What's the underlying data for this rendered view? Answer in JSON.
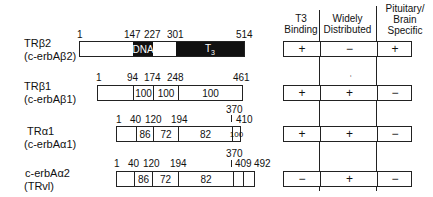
{
  "receptors": [
    {
      "name": "TRβ2",
      "alias": "(c-erbAβ2)",
      "positions": [
        "1",
        "147",
        "227",
        "301",
        "514"
      ],
      "domains": [
        {
          "label": "",
          "style": "white"
        },
        {
          "label": "DNA",
          "style": "black"
        },
        {
          "label": "",
          "style": "white"
        },
        {
          "label": "T3",
          "style": "black"
        }
      ],
      "t3_binding": "+",
      "widely_distributed": "−",
      "pituitary_brain_specific": "+"
    },
    {
      "name": "TRβ1",
      "alias": "(c-erbAβ1)",
      "positions": [
        "1",
        "94",
        "174",
        "248",
        "461"
      ],
      "domains": [
        {
          "label": "",
          "style": "white"
        },
        {
          "label": "100",
          "style": "white"
        },
        {
          "label": "100",
          "style": "white"
        },
        {
          "label": "100",
          "style": "white"
        }
      ],
      "t3_binding": "+",
      "widely_distributed": "+",
      "pituitary_brain_specific": "−"
    },
    {
      "name": "TRα1",
      "alias": "(c-erbAα1)",
      "positions": [
        "1",
        "40",
        "120",
        "194",
        "370",
        "410"
      ],
      "domains": [
        {
          "label": "",
          "style": "white"
        },
        {
          "label": "86",
          "style": "white"
        },
        {
          "label": "72",
          "style": "white"
        },
        {
          "label": "82",
          "style": "white"
        },
        {
          "label": "100",
          "style": "white"
        }
      ],
      "t3_binding": "+",
      "widely_distributed": "+",
      "pituitary_brain_specific": "−"
    },
    {
      "name": "c-erbAα2",
      "alias": "(TRvl)",
      "positions": [
        "1",
        "40",
        "120",
        "194",
        "370",
        "409",
        "492"
      ],
      "domains": [
        {
          "label": "",
          "style": "white"
        },
        {
          "label": "86",
          "style": "white"
        },
        {
          "label": "72",
          "style": "white"
        },
        {
          "label": "82",
          "style": "white"
        },
        {
          "label": "",
          "style": "white"
        },
        {
          "label": "",
          "style": "white"
        }
      ],
      "t3_binding": "−",
      "widely_distributed": "+",
      "pituitary_brain_specific": "−"
    }
  ],
  "table_headers": {
    "t3_binding": [
      "T3",
      "Binding"
    ],
    "widely_distributed": [
      "Widely",
      "Distributed"
    ],
    "pituitary_brain_specific": [
      "Pituitary/",
      "Brain",
      "Specific"
    ]
  },
  "stray_mark": "‘",
  "colors": {
    "line": "#222222",
    "fill_black": "#111111",
    "background": "#ffffff"
  }
}
